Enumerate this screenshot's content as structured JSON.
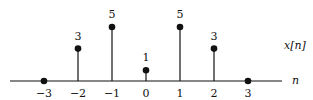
{
  "chart_data": {
    "type": "stem",
    "title": "",
    "xlabel": "n",
    "ylabel": "x[n]",
    "x": [
      -3,
      -2,
      -1,
      0,
      1,
      2,
      3
    ],
    "values": [
      0,
      3,
      5,
      1,
      5,
      3,
      0
    ],
    "value_labels": [
      "",
      "3",
      "5",
      "1",
      "5",
      "3",
      ""
    ],
    "tick_labels": [
      "−3",
      "−2",
      "−1",
      "0",
      "1",
      "2",
      "3"
    ],
    "xlim": [
      -4,
      4
    ],
    "ylim": [
      0,
      5
    ],
    "grid": false,
    "legend": "none"
  },
  "colors": {
    "ink": "#111111",
    "background": "#ffffff"
  }
}
